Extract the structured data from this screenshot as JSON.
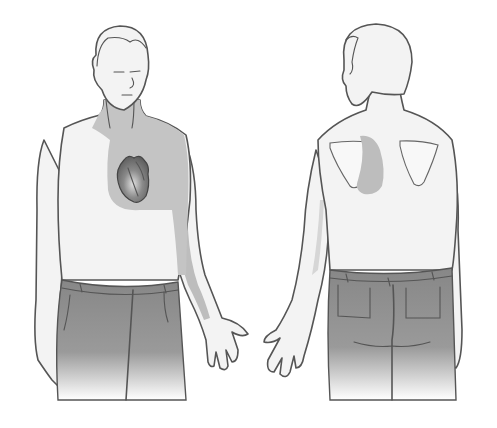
{
  "figure": {
    "colors": {
      "background": "#ffffff",
      "skin": "#f3f3f3",
      "outline": "#555555",
      "pain_shading": "#bdbdbd",
      "trousers_top": "#8a8a8a",
      "trousers_bottom": "#ffffff",
      "heart": "#7a7a7a"
    },
    "views": [
      {
        "id": "front",
        "label": "",
        "pain_regions": [
          "left chest",
          "neck",
          "left arm"
        ]
      },
      {
        "id": "back",
        "label": "",
        "pain_regions": [
          "between shoulder blades (left)"
        ]
      }
    ]
  }
}
